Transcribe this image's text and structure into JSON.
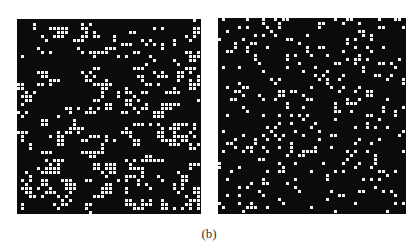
{
  "figure": {
    "caption": "(b)",
    "colors": {
      "background": "#0b0b0b",
      "dot": "#f4f4f4",
      "page": "#ffffff"
    },
    "panels": [
      {
        "id": "left",
        "description": "binary pattern with clustered dots (pairs, 2x2 blocks, short bars), denser toward bottom",
        "grid_step": 4,
        "dot_size": 3,
        "cluster_count": 230,
        "seed": 7,
        "style": "clustered"
      },
      {
        "id": "right",
        "description": "binary pattern with sparse, isolated random dots",
        "grid_step": 4,
        "dot_size": 3,
        "dot_count": 330,
        "seed": 19,
        "style": "scattered"
      }
    ]
  }
}
